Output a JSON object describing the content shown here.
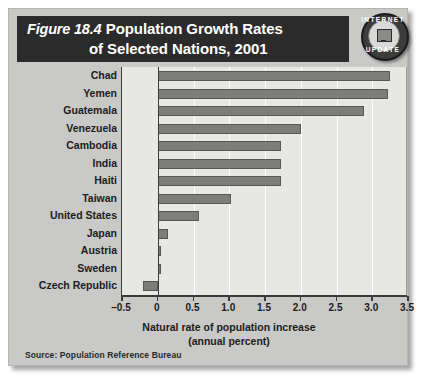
{
  "figure": {
    "number_label": "Figure 18.4",
    "title_line1": "Population Growth Rates",
    "title_line2": "of Selected Nations, 2001",
    "source": "Source:  Population Reference Bureau",
    "badge": {
      "top_word": "INTERNET",
      "bottom_word": "UPDATE",
      "icon": "computer-monitor-icon"
    }
  },
  "colors": {
    "card_background": "#c9c9c7",
    "title_band": "#2b2b2b",
    "plot_background": "#e7e7e5",
    "bar_fill": "#7d7d7b",
    "bar_border": "#575755",
    "gridline": "#fdfdfd",
    "axis": "#3a3a3a",
    "text": "#1c1c1c"
  },
  "chart_data": {
    "type": "bar",
    "orientation": "horizontal",
    "title": "Figure 18.4  Population Growth Rates of Selected Nations, 2001",
    "xlabel": "Natural rate of population increase (annual percent)",
    "xlabel_line1": "Natural rate of population increase",
    "xlabel_line2": "(annual percent)",
    "ylabel": "",
    "xlim": [
      -0.5,
      3.5
    ],
    "xticks": [
      -0.5,
      0,
      0.5,
      1.0,
      1.5,
      2.0,
      2.5,
      3.0,
      3.5
    ],
    "xtick_labels": [
      "–0.5",
      "0",
      "0.5",
      "1.0",
      "1.5",
      "2.0",
      "2.5",
      "3.0",
      "3.5"
    ],
    "grid": true,
    "grid_axis": "x",
    "legend": false,
    "categories": [
      "Chad",
      "Yemen",
      "Guatemala",
      "Venezuela",
      "Cambodia",
      "India",
      "Haiti",
      "Taiwan",
      "United States",
      "Japan",
      "Austria",
      "Sweden",
      "Czech Republic"
    ],
    "values": [
      3.25,
      3.22,
      2.88,
      2.0,
      1.73,
      1.73,
      1.73,
      1.02,
      0.58,
      0.15,
      0.0,
      0.0,
      -0.2
    ],
    "source": "Population Reference Bureau"
  }
}
